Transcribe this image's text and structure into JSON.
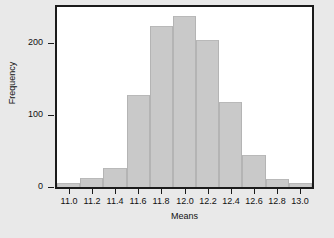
{
  "chart_data": {
    "type": "bar",
    "title": "",
    "subtitle": "",
    "xlabel": "Means",
    "ylabel": "Frequency",
    "xlim": [
      10.9,
      13.1
    ],
    "ylim": [
      0,
      250
    ],
    "bin_width": 0.2,
    "grid": false,
    "legend": null,
    "annotations": [],
    "bar_color": "#c9c9c9",
    "bar_edge_color": "#b4b4b4",
    "plot_background": "#ffffff",
    "figure_background": "#e9e9e9",
    "axis_color": "#1b1b1b",
    "bin_edges": [
      10.9,
      11.1,
      11.3,
      11.5,
      11.7,
      11.9,
      12.1,
      12.3,
      12.5,
      12.7,
      12.9,
      13.1
    ],
    "categories": [
      "10.9-11.1",
      "11.1-11.3",
      "11.3-11.5",
      "11.5-11.7",
      "11.7-11.9",
      "11.9-12.1",
      "12.1-12.3",
      "12.3-12.5",
      "12.5-12.7",
      "12.7-12.9",
      "12.9-13.1"
    ],
    "bin_centers": [
      11.0,
      11.2,
      11.4,
      11.6,
      11.8,
      12.0,
      12.2,
      12.4,
      12.6,
      12.8,
      13.0
    ],
    "values": [
      5,
      12,
      27,
      128,
      223,
      237,
      204,
      118,
      45,
      11,
      5
    ],
    "xticks": [
      11.0,
      11.2,
      11.4,
      11.6,
      11.8,
      12.0,
      12.2,
      12.4,
      12.6,
      12.8,
      13.0
    ],
    "xtick_labels": [
      "11.0",
      "11.2",
      "11.4",
      "11.6",
      "11.8",
      "12.0",
      "12.2",
      "12.4",
      "12.6",
      "12.8",
      "13.0"
    ],
    "yticks": [
      0,
      100,
      200
    ],
    "ytick_labels": [
      "0",
      "100",
      "200"
    ]
  }
}
